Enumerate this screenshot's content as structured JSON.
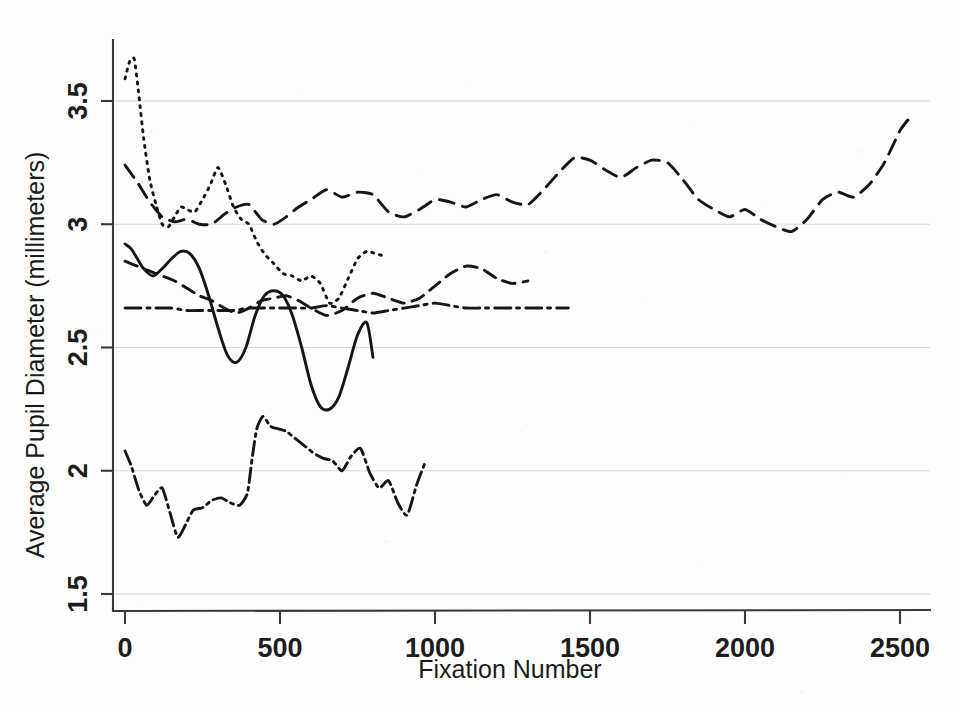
{
  "chart_data": {
    "type": "line",
    "title": "",
    "xlabel": "Fixation Number",
    "ylabel": "Average Pupil Diameter (millimeters)",
    "xlim": [
      -60,
      2620
    ],
    "ylim": [
      1.42,
      3.72
    ],
    "xticks": [
      0,
      500,
      1000,
      1500,
      2000,
      2500
    ],
    "xtick_labels": [
      "0",
      "500",
      "1000",
      "1500",
      "2000",
      "2500"
    ],
    "yticks": [
      1.5,
      2,
      2.5,
      3,
      3.5
    ],
    "ytick_labels": [
      "1.5",
      "2",
      "2.5",
      "3",
      "3.5"
    ],
    "grid": "horizontal",
    "legend": "none",
    "series": [
      {
        "name": "Participant 1",
        "linestyle": "dotted",
        "dasharray": "2,6",
        "x": [
          0,
          15,
          30,
          45,
          60,
          80,
          100,
          120,
          140,
          160,
          180,
          200,
          225,
          250,
          275,
          300,
          325,
          350,
          375,
          400,
          425,
          450,
          480,
          510,
          540,
          570,
          600,
          630,
          660,
          690,
          720,
          750,
          780,
          810,
          840
        ],
        "y": [
          3.59,
          3.66,
          3.67,
          3.52,
          3.35,
          3.18,
          3.08,
          3.0,
          2.99,
          3.03,
          3.07,
          3.06,
          3.05,
          3.1,
          3.16,
          3.23,
          3.16,
          3.07,
          3.02,
          3.0,
          2.93,
          2.88,
          2.84,
          2.8,
          2.79,
          2.77,
          2.79,
          2.76,
          2.68,
          2.7,
          2.78,
          2.86,
          2.89,
          2.88,
          2.87
        ]
      },
      {
        "name": "Participant 2",
        "linestyle": "long-dash",
        "dasharray": "15,9",
        "x": [
          0,
          40,
          80,
          120,
          160,
          200,
          240,
          280,
          320,
          360,
          400,
          440,
          480,
          520,
          560,
          600,
          650,
          700,
          750,
          800,
          850,
          900,
          950,
          1000,
          1050,
          1100,
          1150,
          1200,
          1250,
          1300,
          1350,
          1400,
          1450,
          1500,
          1550,
          1600,
          1650,
          1700,
          1750,
          1800,
          1850,
          1900,
          1950,
          2000,
          2050,
          2100,
          2150,
          2200,
          2250,
          2300,
          2350,
          2400,
          2450,
          2500,
          2530
        ],
        "y": [
          3.24,
          3.17,
          3.09,
          3.03,
          3.01,
          3.02,
          3.0,
          3.0,
          3.04,
          3.07,
          3.08,
          3.02,
          3.0,
          3.03,
          3.07,
          3.1,
          3.14,
          3.11,
          3.13,
          3.12,
          3.05,
          3.03,
          3.06,
          3.1,
          3.09,
          3.07,
          3.1,
          3.12,
          3.09,
          3.08,
          3.14,
          3.21,
          3.27,
          3.26,
          3.22,
          3.19,
          3.23,
          3.26,
          3.25,
          3.18,
          3.1,
          3.06,
          3.03,
          3.06,
          3.02,
          2.99,
          2.97,
          3.02,
          3.1,
          3.13,
          3.11,
          3.16,
          3.25,
          3.38,
          3.43
        ]
      },
      {
        "name": "Participant 3",
        "linestyle": "solid",
        "dasharray": "none",
        "x": [
          0,
          20,
          40,
          60,
          90,
          120,
          150,
          180,
          210,
          240,
          270,
          300,
          330,
          360,
          390,
          420,
          450,
          480,
          510,
          540,
          570,
          600,
          630,
          660,
          690,
          720,
          750,
          780,
          800
        ],
        "y": [
          2.92,
          2.9,
          2.86,
          2.82,
          2.79,
          2.82,
          2.86,
          2.89,
          2.88,
          2.82,
          2.71,
          2.58,
          2.47,
          2.44,
          2.5,
          2.63,
          2.71,
          2.73,
          2.71,
          2.63,
          2.5,
          2.35,
          2.26,
          2.25,
          2.3,
          2.42,
          2.55,
          2.6,
          2.46
        ]
      },
      {
        "name": "Participant 4",
        "linestyle": "medium-dash",
        "dasharray": "13,8",
        "x": [
          0,
          40,
          80,
          120,
          160,
          200,
          240,
          280,
          320,
          360,
          400,
          440,
          480,
          520,
          560,
          600,
          650,
          700,
          750,
          800,
          850,
          900,
          950,
          1000,
          1050,
          1100,
          1150,
          1200,
          1250,
          1300
        ],
        "y": [
          2.85,
          2.83,
          2.81,
          2.79,
          2.77,
          2.74,
          2.71,
          2.69,
          2.66,
          2.64,
          2.66,
          2.69,
          2.7,
          2.71,
          2.69,
          2.66,
          2.63,
          2.65,
          2.7,
          2.72,
          2.7,
          2.68,
          2.7,
          2.75,
          2.8,
          2.83,
          2.82,
          2.78,
          2.76,
          2.77
        ]
      },
      {
        "name": "Participant 5",
        "linestyle": "dash-dot",
        "dasharray": "16,6,3,6",
        "x": [
          0,
          50,
          100,
          150,
          200,
          250,
          300,
          350,
          400,
          450,
          500,
          550,
          600,
          650,
          700,
          750,
          800,
          850,
          900,
          950,
          1000,
          1050,
          1100,
          1150,
          1200,
          1250,
          1300,
          1350,
          1400,
          1430
        ],
        "y": [
          2.66,
          2.66,
          2.66,
          2.66,
          2.65,
          2.65,
          2.65,
          2.65,
          2.66,
          2.66,
          2.66,
          2.66,
          2.66,
          2.67,
          2.66,
          2.65,
          2.64,
          2.65,
          2.66,
          2.67,
          2.68,
          2.67,
          2.66,
          2.66,
          2.66,
          2.66,
          2.66,
          2.66,
          2.66,
          2.66
        ]
      },
      {
        "name": "Participant 6",
        "linestyle": "dash-dot",
        "dasharray": "14,5,3,5",
        "x": [
          0,
          20,
          45,
          70,
          95,
          120,
          145,
          170,
          195,
          220,
          250,
          280,
          310,
          340,
          370,
          395,
          410,
          425,
          445,
          470,
          495,
          520,
          550,
          580,
          610,
          640,
          670,
          700,
          730,
          760,
          790,
          820,
          850,
          880,
          910,
          940,
          970
        ],
        "y": [
          2.08,
          2.02,
          1.92,
          1.86,
          1.9,
          1.93,
          1.83,
          1.73,
          1.78,
          1.84,
          1.85,
          1.88,
          1.89,
          1.87,
          1.86,
          1.91,
          2.05,
          2.17,
          2.22,
          2.18,
          2.17,
          2.16,
          2.13,
          2.1,
          2.07,
          2.05,
          2.04,
          2.0,
          2.06,
          2.09,
          1.99,
          1.93,
          1.96,
          1.87,
          1.82,
          1.94,
          2.04
        ]
      }
    ]
  },
  "axes": {
    "x_label": "Fixation Number",
    "y_label": "Average Pupil Diameter (millimeters)"
  }
}
